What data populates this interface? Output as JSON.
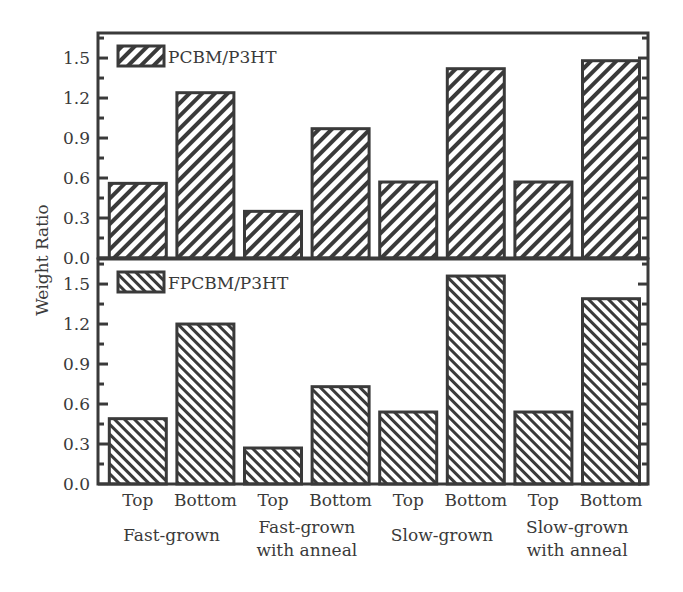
{
  "chart_data": [
    {
      "type": "bar",
      "panel": "top",
      "title": "",
      "xlabel": "",
      "ylabel": "Weight Ratio",
      "ylim": [
        0.0,
        1.65
      ],
      "yticks": [
        0.0,
        0.3,
        0.6,
        0.9,
        1.2,
        1.5
      ],
      "ytick_labels": [
        "0.0",
        "0.3",
        "0.6",
        "0.9",
        "1.2",
        "1.5"
      ],
      "categories": [
        "Top",
        "Bottom",
        "Top",
        "Bottom",
        "Top",
        "Bottom",
        "Top",
        "Bottom"
      ],
      "groups": [
        {
          "label_lines": [
            "Fast-grown"
          ]
        },
        {
          "label_lines": [
            "Fast-grown",
            "with anneal"
          ]
        },
        {
          "label_lines": [
            "Slow-grown"
          ]
        },
        {
          "label_lines": [
            "Slow-grown",
            "with anneal"
          ]
        }
      ],
      "series": [
        {
          "name": "PCBM/P3HT",
          "hatch": "backslash",
          "values": [
            0.56,
            1.24,
            0.35,
            0.97,
            0.57,
            1.42,
            0.57,
            1.48
          ]
        }
      ],
      "legend": {
        "position": "top-left",
        "entries": [
          "PCBM/P3HT"
        ]
      },
      "grid": false
    },
    {
      "type": "bar",
      "panel": "bottom",
      "title": "",
      "xlabel": "",
      "ylabel": "Weight Ratio",
      "ylim": [
        0.0,
        1.65
      ],
      "yticks": [
        0.0,
        0.3,
        0.6,
        0.9,
        1.2,
        1.5
      ],
      "ytick_labels": [
        "0.0",
        "0.3",
        "0.6",
        "0.9",
        "1.2",
        "1.5"
      ],
      "categories": [
        "Top",
        "Bottom",
        "Top",
        "Bottom",
        "Top",
        "Bottom",
        "Top",
        "Bottom"
      ],
      "groups": [
        {
          "label_lines": [
            "Fast-grown"
          ]
        },
        {
          "label_lines": [
            "Fast-grown",
            "with anneal"
          ]
        },
        {
          "label_lines": [
            "Slow-grown"
          ]
        },
        {
          "label_lines": [
            "Slow-grown",
            "with anneal"
          ]
        }
      ],
      "series": [
        {
          "name": "FPCBM/P3HT",
          "hatch": "slash",
          "values": [
            0.49,
            1.2,
            0.27,
            0.73,
            0.54,
            1.56,
            0.54,
            1.39
          ]
        }
      ],
      "legend": {
        "position": "top-left",
        "entries": [
          "FPCBM/P3HT"
        ]
      },
      "grid": false
    }
  ],
  "shared_ylabel": "Weight Ratio",
  "colors": {
    "ink": "#3a3a3a",
    "background": "#ffffff"
  }
}
